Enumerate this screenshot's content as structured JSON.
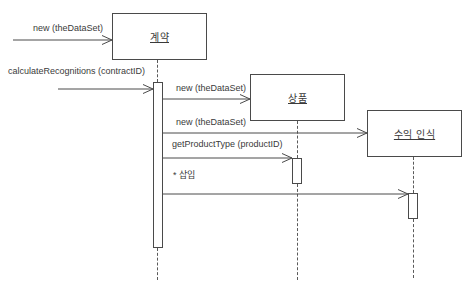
{
  "diagram": {
    "kind": "uml-sequence-diagram",
    "objects": [
      {
        "id": "contract",
        "label": "계약"
      },
      {
        "id": "product",
        "label": "상품"
      },
      {
        "id": "revenue-recognition",
        "label": "수익 인식"
      }
    ],
    "messages": [
      {
        "id": "new-contract",
        "label": "new (theDataSet)",
        "to": "계약"
      },
      {
        "id": "calculate-recognitions",
        "label": "calculateRecognitions (contractID)",
        "to": "계약"
      },
      {
        "id": "new-product",
        "label": "new (theDataSet)",
        "to": "상품"
      },
      {
        "id": "new-revenue",
        "label": "new (theDataSet)",
        "to": "수익 인식"
      },
      {
        "id": "get-product-type",
        "label": "getProductType (productID)",
        "to": "상품"
      },
      {
        "id": "insert",
        "label": "* 삽입",
        "to": "수익 인식"
      }
    ],
    "colors": {
      "line": "#4a4a4a",
      "text": "#3a3a3a",
      "background": "#ffffff"
    }
  }
}
